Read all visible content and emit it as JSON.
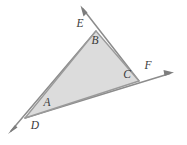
{
  "figure": {
    "canvas": {
      "width": 187,
      "height": 145
    },
    "colors": {
      "background": "#ffffff",
      "triangle_fill": "#dcdcdc",
      "stroke": "#8c8c8c",
      "label_text": "#3a3a3a"
    },
    "triangle": {
      "name": "shaded-triangle",
      "vertices": [
        {
          "name": "lower-left-vertex",
          "x": 25,
          "y": 118
        },
        {
          "name": "top-vertex",
          "x": 96,
          "y": 31
        },
        {
          "name": "right-vertex",
          "x": 139,
          "y": 81
        }
      ]
    },
    "interior_labels": [
      {
        "text": "A",
        "x": 47,
        "y": 103
      },
      {
        "text": "B",
        "x": 95,
        "y": 41
      },
      {
        "text": "C",
        "x": 127,
        "y": 75
      }
    ],
    "ray_labels": [
      {
        "text": "D",
        "x": 35,
        "y": 126
      },
      {
        "text": "E",
        "x": 80,
        "y": 24
      },
      {
        "text": "F",
        "x": 148,
        "y": 66
      }
    ],
    "rays": [
      {
        "name": "ray-toward-D",
        "label": "D",
        "from_x": 25,
        "from_y": 118,
        "to_x": 9,
        "to_y": 133,
        "direction": "down-left"
      },
      {
        "name": "ray-toward-E",
        "label": "E",
        "from_x": 96,
        "from_y": 31,
        "to_x": 81,
        "to_y": 7,
        "direction": "up-left-of-apex"
      },
      {
        "name": "ray-toward-F",
        "label": "F",
        "from_x": 139,
        "from_y": 81,
        "to_x": 173,
        "to_y": 73,
        "direction": "right"
      }
    ]
  }
}
